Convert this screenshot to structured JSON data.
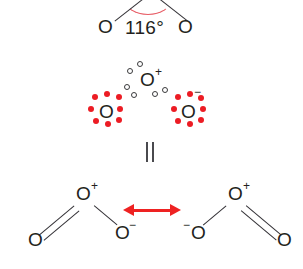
{
  "figure": {
    "molecule": "ozone",
    "background_color": "#ffffff",
    "ink_color": "#231f20",
    "accent_red": "#ec1c24",
    "arrow_red": "#ee2222",
    "arc_red": "#e8616a"
  },
  "panels": {
    "geometry": {
      "name": "bond-angle-structure",
      "angle_label": "116°",
      "left_atom": "O",
      "right_atom": "O",
      "arc_marker": "angle-arc"
    },
    "lewis": {
      "name": "lewis-dot-structure",
      "central_atom": "O",
      "central_charge": "+",
      "left_atom": "O",
      "right_atom": "O",
      "right_charge": "−",
      "central_dots_style": "open",
      "terminal_dots_style": "filled-red",
      "central_lone_pair_dots": 6,
      "left_lone_dots": 8,
      "right_lone_dots": 8
    },
    "equivalence": {
      "name": "equivalence-symbol",
      "symbol": "="
    },
    "resonance": {
      "name": "resonance-pair",
      "arrow_symbol": "↔",
      "left_structure": {
        "central_atom": "O",
        "central_charge": "+",
        "double_bond_atom": "O",
        "single_bond_atom": "O",
        "single_bond_charge": "−",
        "double_bond_side": "left"
      },
      "right_structure": {
        "central_atom": "O",
        "central_charge": "+",
        "double_bond_atom": "O",
        "single_bond_atom": "O",
        "single_bond_charge": "−",
        "double_bond_side": "right"
      }
    }
  }
}
